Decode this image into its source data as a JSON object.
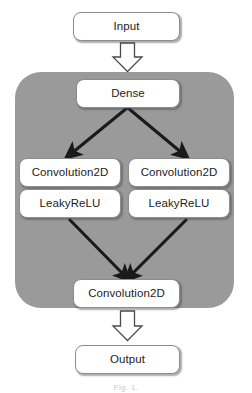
{
  "figure": {
    "caption": "Fig. 1.",
    "background_color": "#ffffff",
    "panel_color": "#9a9a9a",
    "node_fill": "#ffffff",
    "node_border": "#8d8d8d",
    "arrow_color": "#1a1a1a",
    "text_color": "#1c1c1c"
  },
  "nodes": {
    "input": "Input",
    "dense": "Dense",
    "conv_left": "Convolution2D",
    "relu_left": "LeakyReLU",
    "conv_right": "Convolution2D",
    "relu_right": "LeakyReLU",
    "conv_bottom": "Convolution2D",
    "output": "Output"
  },
  "arrows": {
    "input_to_dense": "hollow-block-arrow-down",
    "dense_to_conv_left": "solid-arrow-down-left",
    "dense_to_conv_right": "solid-arrow-down-right",
    "relu_left_to_conv_bottom": "solid-arrow-down-right",
    "relu_right_to_conv_bottom": "solid-arrow-down-left",
    "conv_bottom_to_output": "hollow-block-arrow-down"
  }
}
